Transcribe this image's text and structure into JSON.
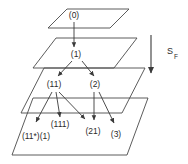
{
  "figure": {
    "background_color": "#ffffff",
    "line_color": "#4a4a4a",
    "text_color": "#2b2b2b"
  },
  "levels": [
    {
      "index": 0,
      "name": "level-0"
    },
    {
      "index": 1,
      "name": "level-1"
    },
    {
      "index": 2,
      "name": "level-2"
    },
    {
      "index": 3,
      "name": "level-3"
    }
  ],
  "nodes": [
    {
      "id": "n0",
      "label": "(0)",
      "level": 0,
      "x": 74,
      "y": 16
    },
    {
      "id": "n1",
      "label": "(1)",
      "level": 1,
      "x": 76,
      "y": 55
    },
    {
      "id": "n11",
      "label": "(11)",
      "level": 2,
      "x": 54,
      "y": 85
    },
    {
      "id": "n2",
      "label": "(2)",
      "level": 2,
      "x": 95,
      "y": 85
    },
    {
      "id": "n11s",
      "label": "(11*)(1)",
      "level": 3,
      "x": 36,
      "y": 137
    },
    {
      "id": "n111",
      "label": "(111)",
      "level": 3,
      "x": 60,
      "y": 125
    },
    {
      "id": "n21",
      "label": "(21)",
      "level": 3,
      "x": 93,
      "y": 132
    },
    {
      "id": "n3",
      "label": "(3)",
      "level": 3,
      "x": 116,
      "y": 135
    }
  ],
  "axis": {
    "label": "S",
    "subscript": "F",
    "direction": "down",
    "name": "s-f-axis"
  }
}
